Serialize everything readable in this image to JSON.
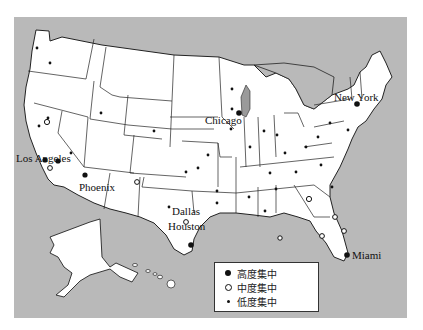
{
  "map": {
    "region": "United States (contiguous states, Alaska, Hawaii)",
    "colors": {
      "water": "#b9b9b9",
      "land": "#ffffff",
      "border": "#222222",
      "lake": "#9a9a9a"
    },
    "cities": [
      {
        "name": "Los Angeles",
        "level": "high",
        "label_x": 2,
        "label_y": 153
      },
      {
        "name": "Phoenix",
        "level": "high",
        "label_x": 77,
        "label_y": 177
      },
      {
        "name": "Chicago",
        "level": "high",
        "label_x": 225,
        "label_y": 112
      },
      {
        "name": "New York",
        "level": "high",
        "label_x": 334,
        "label_y": 92
      },
      {
        "name": "Dallas",
        "level": "mid",
        "label_x": 158,
        "label_y": 198
      },
      {
        "name": "Houston",
        "level": "high",
        "label_x": 156,
        "label_y": 216
      },
      {
        "name": "Miami",
        "level": "high",
        "label_x": 328,
        "label_y": 250
      }
    ]
  },
  "legend": {
    "items": [
      {
        "symbol": "filled-large-dot",
        "label": "高度集中"
      },
      {
        "symbol": "hollow-circle",
        "label": "中度集中"
      },
      {
        "symbol": "small-dot",
        "label": "低度集中"
      }
    ]
  }
}
